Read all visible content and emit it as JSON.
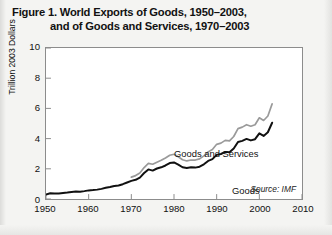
{
  "figure": {
    "title_line1": "Figure 1. World Exports of Goods, 1950–2003,",
    "title_line2": "and of Goods and Services, 1970–2003",
    "source": "Source: IMF"
  },
  "chart_data": {
    "type": "line",
    "title": "Figure 1. World Exports of Goods, 1950–2003, and of Goods and Services, 1970–2003",
    "xlabel": "",
    "ylabel": "Trillion 2003 Dollars",
    "xlim": [
      1950,
      2010
    ],
    "ylim": [
      0,
      10
    ],
    "xticks": [
      1950,
      1960,
      1970,
      1980,
      1990,
      2000,
      2010
    ],
    "yticks": [
      0,
      2,
      4,
      6,
      8,
      10
    ],
    "xtick_labels": [
      "1950",
      "1960",
      "1970",
      "1980",
      "1990",
      "2000",
      "2010"
    ],
    "ytick_labels": [
      "0",
      "2",
      "4",
      "6",
      "8",
      "10"
    ],
    "grid": false,
    "legend": "inline-annotations",
    "annotations": [
      {
        "text": "Goods and Services",
        "x": 1978,
        "y": 5.3
      },
      {
        "text": "Goods",
        "x": 1992,
        "y": 3.0
      },
      {
        "text": "Source: IMF",
        "x": 2005,
        "y": 0.55
      }
    ],
    "series": [
      {
        "name": "Goods",
        "color": "#111111",
        "x": [
          1950,
          1951,
          1952,
          1953,
          1954,
          1955,
          1956,
          1957,
          1958,
          1959,
          1960,
          1961,
          1962,
          1963,
          1964,
          1965,
          1966,
          1967,
          1968,
          1969,
          1970,
          1971,
          1972,
          1973,
          1974,
          1975,
          1976,
          1977,
          1978,
          1979,
          1980,
          1981,
          1982,
          1983,
          1984,
          1985,
          1986,
          1987,
          1988,
          1989,
          1990,
          1991,
          1992,
          1993,
          1994,
          1995,
          1996,
          1997,
          1998,
          1999,
          2000,
          2001,
          2002,
          2003
        ],
        "values": [
          0.3,
          0.38,
          0.36,
          0.37,
          0.4,
          0.43,
          0.47,
          0.49,
          0.48,
          0.52,
          0.57,
          0.59,
          0.62,
          0.67,
          0.74,
          0.79,
          0.86,
          0.89,
          0.98,
          1.09,
          1.2,
          1.27,
          1.42,
          1.72,
          1.96,
          1.88,
          2.02,
          2.1,
          2.22,
          2.38,
          2.42,
          2.28,
          2.1,
          2.05,
          2.1,
          2.08,
          2.14,
          2.3,
          2.52,
          2.64,
          2.92,
          2.98,
          3.12,
          3.1,
          3.35,
          3.78,
          3.85,
          3.98,
          3.88,
          3.96,
          4.35,
          4.18,
          4.42,
          5.05
        ],
        "note": "Black line; world exports of goods only"
      },
      {
        "name": "Goods and Services",
        "color": "#9a9a9a",
        "x": [
          1970,
          1971,
          1972,
          1973,
          1974,
          1975,
          1976,
          1977,
          1978,
          1979,
          1980,
          1981,
          1982,
          1983,
          1984,
          1985,
          1986,
          1987,
          1988,
          1989,
          1990,
          1991,
          1992,
          1993,
          1994,
          1995,
          1996,
          1997,
          1998,
          1999,
          2000,
          2001,
          2002,
          2003
        ],
        "values": [
          1.45,
          1.55,
          1.72,
          2.08,
          2.36,
          2.3,
          2.44,
          2.56,
          2.72,
          2.9,
          2.96,
          2.8,
          2.6,
          2.52,
          2.58,
          2.58,
          2.66,
          2.86,
          3.12,
          3.28,
          3.62,
          3.7,
          3.88,
          3.85,
          4.14,
          4.66,
          4.76,
          4.92,
          4.82,
          4.92,
          5.38,
          5.2,
          5.5,
          6.3
        ],
        "note": "Gray line; world exports of goods and services"
      }
    ]
  }
}
